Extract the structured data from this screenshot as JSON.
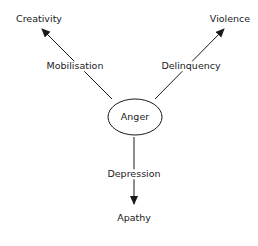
{
  "diagram": {
    "center": {
      "label": "Anger"
    },
    "outcomes": [
      {
        "label": "Creativity",
        "path_label": "Mobilisation"
      },
      {
        "label": "Violence",
        "path_label": "Delinquency"
      },
      {
        "label": "Apathy",
        "path_label": "Depression"
      }
    ],
    "colors": {
      "stroke": "#1a1a1a",
      "background": "#ffffff"
    }
  }
}
